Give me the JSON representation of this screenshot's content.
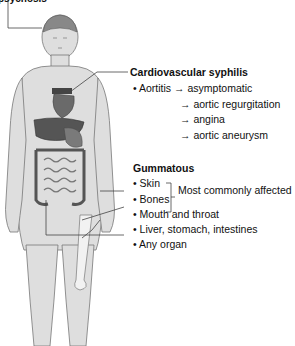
{
  "top_label": "psychosis",
  "cardiovascular": {
    "title": "Cardiovascular syphilis",
    "item": "Aortitis",
    "arrow": "→",
    "outcomes": [
      "asymptomatic",
      "aortic regurgitation",
      "angina",
      "aortic aneurysm"
    ]
  },
  "gummatous": {
    "title": "Gummatous",
    "bullet": "•",
    "items": [
      "Skin",
      "Bones",
      "Mouth and throat",
      "Liver, stomach, intestines",
      "Any organ"
    ],
    "bracket_note": "Most commonly affected"
  },
  "colors": {
    "skin": "#dcdcdc",
    "outline": "#6e6e6e",
    "organ_dark": "#5a5a5a",
    "organ_mid": "#8a8a8a",
    "leader_line": "#444444"
  }
}
